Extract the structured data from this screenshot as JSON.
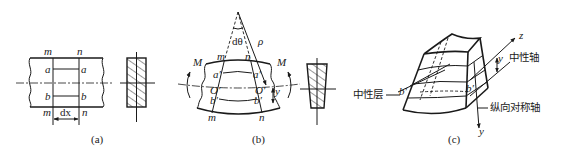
{
  "figure": {
    "panels": [
      {
        "id": "a",
        "caption": "(a)",
        "labels": {
          "m_top": "m",
          "n_top": "n",
          "a_left": "a",
          "a_right": "a",
          "b_left": "b",
          "b_right": "b",
          "m_bottom": "m",
          "n_bottom": "n",
          "dx": "dx"
        },
        "description": "Straight beam segment with section lines m-m and n-n, fibers aa and bb, width dx; rectangular hatched cross-section"
      },
      {
        "id": "b",
        "caption": "(b)",
        "labels": {
          "dtheta": "dθ",
          "rho": "ρ",
          "m_top": "m",
          "n_top": "n",
          "M_left": "M",
          "M_right": "M",
          "a_left": "a′",
          "a_right": "a′",
          "O_left": "O′",
          "O_right": "O′",
          "b_left": "b′",
          "b_right": "b′",
          "y": "y",
          "m_bottom": "m",
          "n_bottom": "n"
        },
        "description": "Bent beam segment under moment M with curvature radius ρ and angle dθ; trapezoidal hatched cross-section"
      },
      {
        "id": "c",
        "caption": "(c)",
        "labels": {
          "z_axis": "z",
          "y_axis": "y",
          "y_dist": "y",
          "b_left": "b′",
          "b_right": "b′",
          "neutral_axis": "中性轴",
          "neutral_layer": "中性层",
          "symmetry_axis": "纵向对称轴"
        },
        "description": "3D view of deformed beam element showing neutral layer, neutral axis and longitudinal symmetry axis"
      }
    ]
  }
}
